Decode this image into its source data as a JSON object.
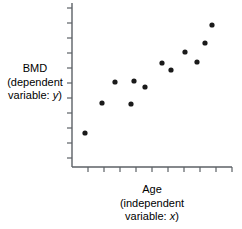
{
  "chart_data": {
    "type": "scatter",
    "title": "",
    "xlabel": "Age (independent variable: x)",
    "ylabel": "BMD (dependent variable: y)",
    "xlabel_lines": [
      "Age",
      "(independent",
      "variable: x)"
    ],
    "ylabel_lines": [
      "BMD",
      "(dependent",
      "variable: y)"
    ],
    "xlabel_main": "Age",
    "xlabel_paren_open": "(independent",
    "xlabel_varline_prefix": "variable: ",
    "xlabel_var": "x",
    "xlabel_varline_suffix": ")",
    "ylabel_main": "BMD",
    "ylabel_paren_open": "(dependent",
    "ylabel_varline_prefix": "variable: ",
    "ylabel_var": "y",
    "ylabel_varline_suffix": ")",
    "x": [
      1,
      2,
      3,
      4,
      4.6,
      5.2,
      5.9,
      6.6,
      7.3,
      8.1,
      8.7,
      9.3
    ],
    "y": [
      1.0,
      2.55,
      2.6,
      3.95,
      3.9,
      3.6,
      4.45,
      4.2,
      5.05,
      4.45,
      5.95,
      6.95
    ],
    "points": [
      {
        "px": 85,
        "py": 133
      },
      {
        "px": 102,
        "py": 103
      },
      {
        "px": 115,
        "py": 82
      },
      {
        "px": 131,
        "py": 104
      },
      {
        "px": 134,
        "py": 81
      },
      {
        "px": 145,
        "py": 87
      },
      {
        "px": 162,
        "py": 63
      },
      {
        "px": 171,
        "py": 70
      },
      {
        "px": 185,
        "py": 52
      },
      {
        "px": 197,
        "py": 62
      },
      {
        "px": 205,
        "py": 43
      },
      {
        "px": 212,
        "py": 25
      }
    ],
    "point_color": "#1a1a1a",
    "point_radius": 2.6,
    "axis_color": "#5c6166",
    "axis_width": 1.4,
    "xlim": [
      0,
      10
    ],
    "ylim": [
      0,
      8
    ],
    "grid": false,
    "legend": "none",
    "x_tick_count": 10,
    "y_tick_count": 11,
    "tick_length": 4,
    "tick_direction": "outward",
    "tick_labels_x": [],
    "tick_labels_y": [],
    "plot_box": {
      "left": 72,
      "right": 232,
      "top": 3,
      "bottom": 167
    }
  }
}
